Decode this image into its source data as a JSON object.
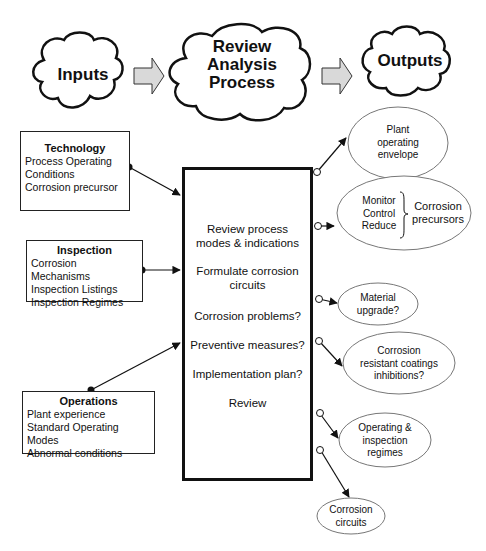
{
  "header": {
    "inputs_cloud": "Inputs",
    "process_cloud": [
      "Review",
      "Analysis",
      "Process"
    ],
    "outputs_cloud": "Outputs"
  },
  "inputs": [
    {
      "title": "Technology",
      "lines": [
        "Process Operating",
        "Conditions",
        "Corrosion precursor"
      ]
    },
    {
      "title": "Inspection",
      "lines": [
        "Corrosion Mechanisms",
        "Inspection Listings",
        "Inspection Regimes"
      ]
    },
    {
      "title": "Operations",
      "lines": [
        "Plant experience",
        "Standard Operating Modes",
        "Abnormal conditions"
      ]
    }
  ],
  "process_steps": [
    [
      "Review process",
      "modes & indications"
    ],
    [
      "Formulate corrosion",
      "circuits"
    ],
    [
      "Corrosion problems?"
    ],
    [
      "Preventive measures?"
    ],
    [
      "Implementation plan?"
    ],
    [
      "Review"
    ]
  ],
  "outputs": [
    {
      "lines": [
        "Plant",
        "operating",
        "envelope"
      ]
    },
    {
      "left_lines": [
        "Monitor",
        "Control",
        "Reduce"
      ],
      "right_lines": [
        "Corrosion",
        "precursors"
      ]
    },
    {
      "lines": [
        "Material",
        "upgrade?"
      ]
    },
    {
      "lines": [
        "Corrosion",
        "resistant coatings",
        "inhibitions?"
      ]
    },
    {
      "lines": [
        "Operating &",
        "inspection",
        "regimes"
      ]
    },
    {
      "lines": [
        "Corrosion",
        "circuits"
      ]
    }
  ],
  "colors": {
    "line": "#111111",
    "arrow_fill": "#d9d9d9",
    "ellipse_stroke": "#777777"
  }
}
